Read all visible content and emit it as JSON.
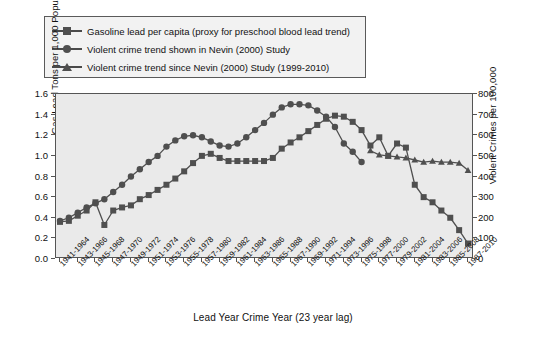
{
  "chart_data": {
    "type": "line",
    "title": "",
    "xlabel": "Lead Year Crime Year (23 year lag)",
    "ylabel": "Gas Lead Tons per 1,000 Population",
    "ylabel_right": "Violent Crimes per 100,000",
    "ylim": [
      0,
      1.6
    ],
    "ylim_right": [
      0,
      800
    ],
    "ytick_labels": [
      "1.6",
      "1.4",
      "1.2",
      "1.0",
      "0.8",
      "0.6",
      "0.4",
      "0.2",
      "0.0"
    ],
    "ytick_values": [
      1.6,
      1.4,
      1.2,
      1.0,
      0.8,
      0.6,
      0.4,
      0.2,
      0.0
    ],
    "ytick_labels_right": [
      "800",
      "700",
      "600",
      "500",
      "400",
      "300",
      "200",
      "100",
      "0"
    ],
    "ytick_values_right": [
      800,
      700,
      600,
      500,
      400,
      300,
      200,
      100,
      0
    ],
    "grid": false,
    "legend_position": "above-plot",
    "categories": [
      "1941-1964",
      "1943-1966",
      "1945-1968",
      "1947-1970",
      "1949-1972",
      "1951-1974",
      "1953-1976",
      "1955-1978",
      "1957-1980",
      "1959-1982",
      "1961-1984",
      "1963-1986",
      "1965-1988",
      "1967-1990",
      "1969-1992",
      "1971-1994",
      "1973-1996",
      "1975-1998",
      "1977-2000",
      "1979-2002",
      "1981-2004",
      "1983-2006",
      "1985-2008",
      "1987-2010"
    ],
    "series": [
      {
        "name": "Gasoline lead per capita (proxy for preschool blood lead trend)",
        "marker": "square",
        "axis": "left",
        "units": "Gas Lead Tons per 1,000 Population",
        "x": [
          "1941-1964",
          "1942-1965",
          "1943-1966",
          "1944-1967",
          "1945-1968",
          "1946-1969",
          "1947-1970",
          "1948-1971",
          "1949-1972",
          "1950-1973",
          "1951-1974",
          "1952-1975",
          "1953-1976",
          "1954-1977",
          "1955-1978",
          "1956-1979",
          "1957-1980",
          "1958-1981",
          "1959-1982",
          "1960-1983",
          "1961-1984",
          "1962-1985",
          "1963-1986",
          "1964-1987",
          "1965-1988",
          "1966-1989",
          "1967-1990",
          "1968-1991",
          "1969-1992",
          "1970-1993",
          "1971-1994",
          "1972-1995",
          "1973-1996",
          "1974-1997",
          "1975-1998",
          "1976-1999",
          "1977-2000",
          "1978-2001",
          "1979-2002",
          "1980-2003",
          "1981-2004",
          "1982-2005",
          "1983-2006",
          "1984-2007",
          "1985-2008",
          "1986-2009",
          "1987-2010"
        ],
        "values": [
          0.36,
          0.37,
          0.42,
          0.47,
          0.55,
          0.33,
          0.47,
          0.5,
          0.52,
          0.58,
          0.62,
          0.67,
          0.72,
          0.78,
          0.85,
          0.93,
          1.0,
          1.02,
          0.98,
          0.95,
          0.95,
          0.95,
          0.95,
          0.95,
          0.98,
          1.07,
          1.13,
          1.18,
          1.24,
          1.3,
          1.36,
          1.39,
          1.38,
          1.33,
          1.25,
          1.1,
          1.18,
          1.0,
          1.12,
          1.08,
          0.72,
          0.6,
          0.55,
          0.47,
          0.4,
          0.28,
          0.15
        ]
      },
      {
        "name": "Violent crime trend shown in Nevin (2000) Study",
        "marker": "circle",
        "axis": "right",
        "units": "Violent Crimes per 100,000",
        "x": [
          "1941-1964",
          "1942-1965",
          "1943-1966",
          "1944-1967",
          "1945-1968",
          "1946-1969",
          "1947-1970",
          "1948-1971",
          "1949-1972",
          "1950-1973",
          "1951-1974",
          "1952-1975",
          "1953-1976",
          "1954-1977",
          "1955-1978",
          "1956-1979",
          "1957-1980",
          "1958-1981",
          "1959-1982",
          "1960-1983",
          "1961-1984",
          "1962-1985",
          "1963-1986",
          "1964-1987",
          "1965-1988",
          "1966-1989",
          "1967-1990",
          "1968-1991",
          "1969-1992",
          "1970-1993",
          "1971-1994",
          "1972-1995",
          "1973-1996",
          "1974-1997",
          "1975-1998"
        ],
        "values": [
          185,
          200,
          225,
          250,
          270,
          290,
          325,
          360,
          400,
          435,
          470,
          500,
          545,
          575,
          595,
          600,
          590,
          570,
          550,
          545,
          560,
          590,
          625,
          660,
          700,
          735,
          750,
          750,
          745,
          720,
          690,
          640,
          560,
          520,
          470
        ]
      },
      {
        "name": "Violent crime trend since Nevin (2000) Study (1999-2010)",
        "marker": "triangle",
        "axis": "right",
        "units": "Violent Crimes per 100,000",
        "x": [
          "1976-1999",
          "1977-2000",
          "1978-2001",
          "1979-2002",
          "1980-2003",
          "1981-2004",
          "1982-2005",
          "1983-2006",
          "1984-2007",
          "1985-2008",
          "1986-2009",
          "1987-2010"
        ],
        "values": [
          525,
          505,
          500,
          495,
          490,
          480,
          470,
          475,
          470,
          470,
          465,
          430
        ]
      }
    ],
    "colors": {
      "series": "#4f4f4f",
      "plot_background": "#eaeaea",
      "figure_background": "#ffffff",
      "axis": "#555555"
    }
  },
  "legend": {
    "items": [
      {
        "marker": "square",
        "label": "Gasoline lead per capita (proxy for preschool blood lead trend)"
      },
      {
        "marker": "circle",
        "label": "Violent crime trend shown in Nevin (2000) Study"
      },
      {
        "marker": "triangle",
        "label": "Violent crime trend since Nevin (2000) Study (1999-2010)"
      }
    ]
  }
}
